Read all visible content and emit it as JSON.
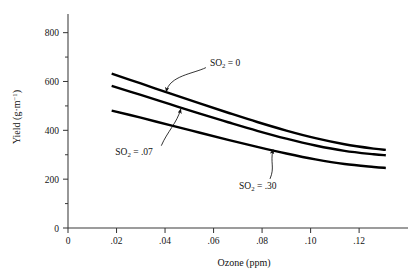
{
  "chart_data": {
    "type": "line",
    "title": "",
    "xlabel": "Ozone (ppm)",
    "ylabel": "Yield (g·m⁻¹)",
    "ylabel_main": "Yield (g·m",
    "ylabel_exp": "−1",
    "ylabel_close": ")",
    "xlim": [
      0,
      0.1385
    ],
    "ylim": [
      0,
      860
    ],
    "xticks": [
      0,
      0.02,
      0.04,
      0.06,
      0.08,
      0.1,
      0.12
    ],
    "xticklabels": [
      "0",
      ".02",
      ".04",
      ".06",
      ".08",
      ".10",
      ".12"
    ],
    "yticks": [
      0,
      200,
      400,
      600,
      800
    ],
    "yticklabels": [
      "0",
      "200",
      "400",
      "600",
      "800"
    ],
    "yminorticks": [
      100,
      300,
      500,
      700
    ],
    "grid": false,
    "legend_position": "inline-annotations",
    "x": [
      0.018,
      0.03,
      0.042,
      0.054,
      0.066,
      0.078,
      0.09,
      0.102,
      0.114,
      0.126,
      0.131
    ],
    "series": [
      {
        "name": "SO2 = 0",
        "label": "SO",
        "sub": "2",
        "eq": " = 0",
        "values": [
          632,
          592,
          551,
          511,
          472,
          434,
          399,
          368,
          343,
          325,
          320
        ]
      },
      {
        "name": "SO2 = .07",
        "label": "SO",
        "sub": "2",
        "eq": " = .07",
        "values": [
          582,
          545,
          507,
          469,
          433,
          398,
          366,
          338,
          316,
          302,
          298
        ]
      },
      {
        "name": "SO2 = .30",
        "label": "SO",
        "sub": "2",
        "eq": " = .30",
        "values": [
          481,
          452,
          421,
          391,
          361,
          332,
          305,
          281,
          262,
          250,
          246
        ]
      }
    ],
    "annotations": [
      {
        "text": "SO2 = 0",
        "x": 0.0585,
        "y": 665,
        "target_x": 0.0405,
        "target_y": 558
      },
      {
        "text": "SO2 = .07",
        "x": 0.0195,
        "y": 300,
        "target_x": 0.0465,
        "target_y": 487
      },
      {
        "text": "SO2 = .30",
        "x": 0.0705,
        "y": 160,
        "target_x": 0.0845,
        "target_y": 322
      }
    ],
    "colors": {
      "line": "#000000",
      "axis": "#3a3a3a",
      "text": "#141414"
    }
  }
}
